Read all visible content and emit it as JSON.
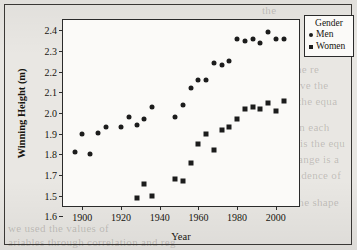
{
  "figure": {
    "x_axis_title": "Year",
    "y_axis_title": "Winning Height (m)"
  },
  "legend": {
    "title": "Gender",
    "entries": [
      {
        "label": "Men",
        "marker": "circle-marker-icon"
      },
      {
        "label": "Women",
        "marker": "square-marker-icon"
      }
    ]
  },
  "scan_background": {
    "lines": [
      {
        "text": "the",
        "x": 262,
        "y": 4,
        "size": 11
      },
      {
        "text": "he. The re",
        "x": 272,
        "y": 63,
        "size": 11
      },
      {
        "text": "ve the",
        "x": 300,
        "y": 79,
        "size": 11
      },
      {
        "text": "the equa",
        "x": 298,
        "y": 95,
        "size": 11
      },
      {
        "text": "in each",
        "x": 296,
        "y": 121,
        "size": 11
      },
      {
        "text": "is the equ",
        "x": 300,
        "y": 137,
        "size": 11
      },
      {
        "text": "ange is a",
        "x": 298,
        "y": 153,
        "size": 11
      },
      {
        "text": "vidence of",
        "x": 292,
        "y": 169,
        "size": 11
      },
      {
        "text": "the shape",
        "x": 295,
        "y": 196,
        "size": 11
      },
      {
        "text": "we used the values of",
        "x": 8,
        "y": 222,
        "size": 11
      },
      {
        "text": "ariables through correlation and reg",
        "x": 8,
        "y": 236,
        "size": 11
      }
    ]
  },
  "chart_data": {
    "type": "scatter",
    "title": "",
    "xlabel": "Year",
    "ylabel": "Winning Height (m)",
    "xlim": [
      1890,
      2012
    ],
    "ylim": [
      1.55,
      2.45
    ],
    "grid": false,
    "legend_position": "outside-top-right",
    "xticks": [
      1900,
      1920,
      1940,
      1960,
      1980,
      2000
    ],
    "yticks_displayed": [
      "2.4",
      "2.3",
      "2.2",
      "2.1",
      "2.0",
      "1.9",
      "1.8",
      "1.7",
      "1.5",
      "1.6"
    ],
    "yticks_values": [
      2.4,
      2.3,
      2.2,
      2.1,
      2.0,
      1.9,
      1.8,
      1.7,
      1.6,
      1.5
    ],
    "series": [
      {
        "name": "Men",
        "marker": "circle",
        "color": "#1c1c1c",
        "points": [
          [
            1896,
            1.81
          ],
          [
            1900,
            1.9
          ],
          [
            1904,
            1.8
          ],
          [
            1908,
            1.905
          ],
          [
            1912,
            1.93
          ],
          [
            1920,
            1.93
          ],
          [
            1924,
            1.98
          ],
          [
            1928,
            1.94
          ],
          [
            1932,
            1.97
          ],
          [
            1936,
            2.03
          ],
          [
            1948,
            1.98
          ],
          [
            1952,
            2.04
          ],
          [
            1956,
            2.12
          ],
          [
            1960,
            2.16
          ],
          [
            1964,
            2.16
          ],
          [
            1968,
            2.24
          ],
          [
            1972,
            2.23
          ],
          [
            1976,
            2.25
          ],
          [
            1980,
            2.36
          ],
          [
            1984,
            2.35
          ],
          [
            1988,
            2.36
          ],
          [
            1992,
            2.34
          ],
          [
            1996,
            2.39
          ],
          [
            2000,
            2.36
          ],
          [
            2004,
            2.36
          ]
        ]
      },
      {
        "name": "Women",
        "marker": "square",
        "color": "#1c1c1c",
        "points": [
          [
            1928,
            1.59
          ],
          [
            1932,
            1.655
          ],
          [
            1936,
            1.6
          ],
          [
            1948,
            1.68
          ],
          [
            1952,
            1.67
          ],
          [
            1956,
            1.76
          ],
          [
            1960,
            1.85
          ],
          [
            1964,
            1.9
          ],
          [
            1968,
            1.82
          ],
          [
            1972,
            1.92
          ],
          [
            1976,
            1.93
          ],
          [
            1980,
            1.97
          ],
          [
            1984,
            2.02
          ],
          [
            1988,
            2.03
          ],
          [
            1992,
            2.02
          ],
          [
            1996,
            2.05
          ],
          [
            2000,
            2.01
          ],
          [
            2004,
            2.06
          ]
        ]
      }
    ]
  }
}
